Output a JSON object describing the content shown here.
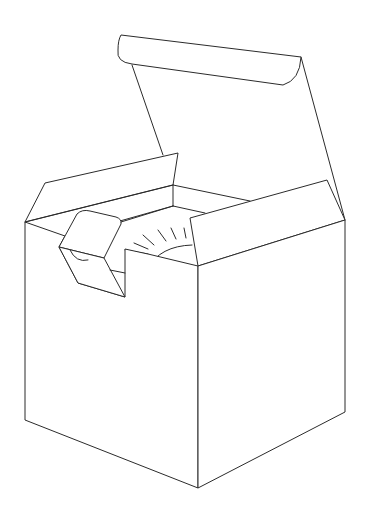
{
  "figure": {
    "title": "Open gift box line drawing",
    "stroke_color": "#2b2b2b",
    "background_color": "#ffffff"
  },
  "parts": {
    "lid": "Raised lid with curled tuck flap",
    "left_flap": "Open left side flap",
    "right_flap": "Open right side flap",
    "insert": "Folded insert tab with semicircle cutout",
    "disc": "Round object with radiating tick marks",
    "left_face": "Front-left box face",
    "right_face": "Front-right box face"
  }
}
